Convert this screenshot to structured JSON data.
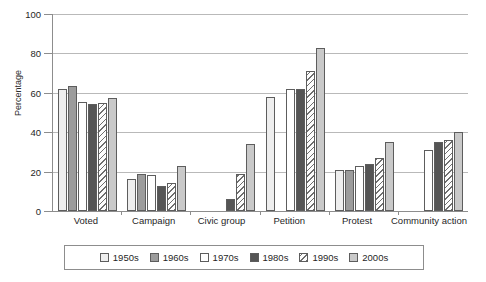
{
  "chart_data": {
    "type": "bar",
    "title": "",
    "xlabel": "",
    "ylabel": "Percentage",
    "ylim": [
      0,
      100
    ],
    "ytick_step": 20,
    "yticks": [
      0,
      20,
      40,
      60,
      80,
      100
    ],
    "grid": true,
    "legend_position": "bottom",
    "categories": [
      "Voted",
      "Campaign",
      "Civic group",
      "Petition",
      "Protest",
      "Community action"
    ],
    "series": [
      {
        "name": "1950s",
        "color": "#eeeeee",
        "values": [
          62,
          16,
          0,
          58,
          21,
          0
        ]
      },
      {
        "name": "1960s",
        "color": "#9c9c9c",
        "values": [
          63.5,
          19,
          0,
          0,
          21,
          0
        ]
      },
      {
        "name": "1970s",
        "color": "#ffffff",
        "values": [
          55.5,
          18.5,
          0,
          62,
          23,
          31
        ]
      },
      {
        "name": "1980s",
        "color": "#555555",
        "values": [
          54.5,
          12.5,
          6,
          62,
          24,
          35
        ]
      },
      {
        "name": "1990s",
        "color": "#fdfdfd",
        "values": [
          55,
          14,
          19,
          71,
          27,
          36
        ]
      },
      {
        "name": "2000s",
        "color": "#c9c9c9",
        "values": [
          57.5,
          23,
          34,
          83,
          35,
          40
        ]
      }
    ]
  },
  "legend": {
    "items": [
      {
        "label": "1950s",
        "swatch_class": "f1950"
      },
      {
        "label": "1960s",
        "swatch_class": "f1960"
      },
      {
        "label": "1970s",
        "swatch_class": "f1970"
      },
      {
        "label": "1980s",
        "swatch_class": "f1980"
      },
      {
        "label": "1990s",
        "swatch_class": "f1990"
      },
      {
        "label": "2000s",
        "swatch_class": "f2000"
      }
    ]
  }
}
